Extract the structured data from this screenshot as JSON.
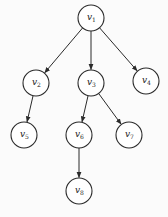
{
  "diagram": {
    "type": "tree",
    "nodes": [
      {
        "id": "v1",
        "label": "v",
        "sub": "1",
        "x": 91,
        "y": 18
      },
      {
        "id": "v2",
        "label": "v",
        "sub": "2",
        "x": 36,
        "y": 83
      },
      {
        "id": "v3",
        "label": "v",
        "sub": "3",
        "x": 91,
        "y": 83
      },
      {
        "id": "v4",
        "label": "v",
        "sub": "4",
        "x": 146,
        "y": 81
      },
      {
        "id": "v5",
        "label": "v",
        "sub": "5",
        "x": 24,
        "y": 135
      },
      {
        "id": "v6",
        "label": "v",
        "sub": "6",
        "x": 79,
        "y": 135
      },
      {
        "id": "v7",
        "label": "v",
        "sub": "7",
        "x": 129,
        "y": 135
      },
      {
        "id": "v8",
        "label": "v",
        "sub": "8",
        "x": 79,
        "y": 191
      }
    ],
    "edges": [
      {
        "from": "v1",
        "to": "v2"
      },
      {
        "from": "v1",
        "to": "v3"
      },
      {
        "from": "v1",
        "to": "v4"
      },
      {
        "from": "v2",
        "to": "v5"
      },
      {
        "from": "v3",
        "to": "v6"
      },
      {
        "from": "v3",
        "to": "v7"
      },
      {
        "from": "v6",
        "to": "v8"
      }
    ],
    "node_radius": 13,
    "stroke_color": "#2a2a2a",
    "background": "#fbfbfb"
  }
}
